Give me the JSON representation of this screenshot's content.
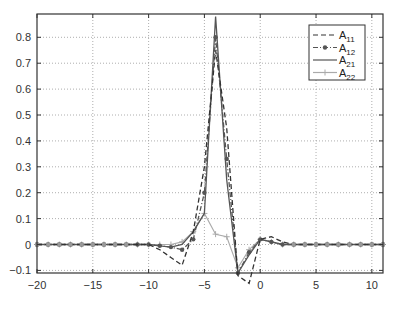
{
  "chart_data": {
    "type": "line",
    "title": "",
    "xlabel": "",
    "ylabel": "",
    "xlim": [
      -20,
      11
    ],
    "ylim": [
      -0.11,
      0.89
    ],
    "grid": true,
    "legend_position": "upper right",
    "x_ticks": [
      -20,
      -15,
      -10,
      -5,
      0,
      5,
      10
    ],
    "x_tick_labels": [
      "-20",
      "-15",
      "-10",
      "-5",
      "0",
      "5",
      "10"
    ],
    "y_ticks": [
      -0.1,
      0,
      0.1,
      0.2,
      0.3,
      0.4,
      0.5,
      0.6,
      0.7,
      0.8
    ],
    "y_tick_labels": [
      "-0.1",
      "0",
      "0.1",
      "0.2",
      "0.3",
      "0.4",
      "0.5",
      "0.6",
      "0.7",
      "0.8"
    ],
    "x": [
      -20,
      -19,
      -18,
      -17,
      -16,
      -15,
      -14,
      -13,
      -12,
      -11,
      -10,
      -9,
      -8,
      -7,
      -6,
      -5,
      -4,
      -3,
      -2,
      -1,
      0,
      1,
      2,
      3,
      4,
      5,
      6,
      7,
      8,
      9,
      10,
      11
    ],
    "series": [
      {
        "name": "A11",
        "label_main": "A",
        "label_sub": "11",
        "style": "dashed",
        "color": "#333333",
        "marker": "none",
        "values": [
          0,
          0,
          0,
          0,
          0,
          0,
          0,
          0,
          0,
          0,
          0,
          -0.02,
          -0.05,
          -0.08,
          0.05,
          0.3,
          0.75,
          0.45,
          -0.12,
          -0.15,
          0.02,
          0.03,
          0.01,
          0,
          0,
          0,
          0,
          0,
          0,
          0,
          0,
          0
        ]
      },
      {
        "name": "A12",
        "label_main": "A",
        "label_sub": "12",
        "style": "dashdot",
        "color": "#555555",
        "marker": "dot",
        "values": [
          0,
          0,
          0,
          0,
          0,
          0,
          0,
          0,
          0,
          0,
          0,
          -0.005,
          -0.01,
          -0.02,
          0.02,
          0.2,
          0.8,
          0.33,
          -0.11,
          -0.03,
          0.02,
          0.01,
          0,
          0,
          0,
          0,
          0,
          0,
          0,
          0,
          0,
          0
        ]
      },
      {
        "name": "A21",
        "label_main": "A",
        "label_sub": "21",
        "style": "solid",
        "color": "#555555",
        "marker": "none",
        "values": [
          0,
          0,
          0,
          0,
          0,
          0,
          0,
          0,
          0,
          0,
          0,
          -0.005,
          -0.01,
          0,
          0.05,
          0.12,
          0.88,
          0.25,
          -0.11,
          -0.04,
          0.02,
          0.01,
          0,
          0,
          0,
          0,
          0,
          0,
          0,
          0,
          0,
          0
        ]
      },
      {
        "name": "A22",
        "label_main": "A",
        "label_sub": "22",
        "style": "solid",
        "color": "#aaaaaa",
        "marker": "plus",
        "values": [
          0,
          0,
          0,
          0,
          0,
          0,
          0,
          0,
          0,
          0,
          0,
          0,
          0,
          0.01,
          0.05,
          0.12,
          0.04,
          0.03,
          -0.09,
          -0.02,
          0.02,
          0.01,
          0,
          0,
          0,
          0,
          0,
          0,
          0,
          0,
          0,
          0
        ]
      }
    ]
  }
}
